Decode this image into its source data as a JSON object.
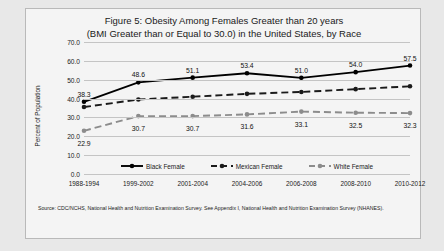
{
  "figure": {
    "title_line1": "Figure 5: Obesity Among Females Greater than 20 years",
    "title_line2": "(BMI Greater than or Equal to 30.0) in the United States, by Race",
    "source_note": "Source: CDC/NCHS, National Health and Nutrition Examination Survey. See Appendix I, National Health and Nutrition Examination Survey (NHANES)."
  },
  "chart_data": {
    "type": "line",
    "title": "Figure 5: Obesity Among Females Greater than 20 years (BMI Greater than or Equal to 30.0) in the United States, by Race",
    "xlabel": "",
    "ylabel": "Percent of Population",
    "ylim": [
      0.0,
      70.0
    ],
    "ytick_step": 10.0,
    "ytick_labels": [
      "0.0",
      "10.0",
      "20.0",
      "30.0",
      "40.0",
      "50.0",
      "60.0",
      "70.0"
    ],
    "grid": true,
    "legend_position": "inside-bottom-center",
    "categories": [
      "1988-1994",
      "1999-2002",
      "2001-2004",
      "2004-2006",
      "2006-2008",
      "2008-2010",
      "2010-2012"
    ],
    "series": [
      {
        "name": "Black Female",
        "color": "#000000",
        "style": "solid",
        "labeled": true,
        "values": [
          38.3,
          48.6,
          51.1,
          53.4,
          51.0,
          54.0,
          57.5
        ],
        "value_labels": [
          "38.3",
          "48.6",
          "51.1",
          "53.4",
          "51.0",
          "54.0",
          "57.5"
        ]
      },
      {
        "name": "Mexican Female",
        "color": "#1a1a1a",
        "style": "dashed",
        "labeled": false,
        "values": [
          35.5,
          39.5,
          41.0,
          42.5,
          43.5,
          45.0,
          46.5
        ],
        "value_labels": [
          "",
          "",
          "",
          "",
          "",
          "",
          ""
        ]
      },
      {
        "name": "White Female",
        "color": "#8c8c8c",
        "style": "dashed",
        "labeled": true,
        "values": [
          22.9,
          30.7,
          30.7,
          31.6,
          33.1,
          32.5,
          32.3
        ],
        "value_labels": [
          "22.9",
          "30.7",
          "30.7",
          "31.6",
          "33.1",
          "32.5",
          "32.3"
        ]
      }
    ]
  }
}
